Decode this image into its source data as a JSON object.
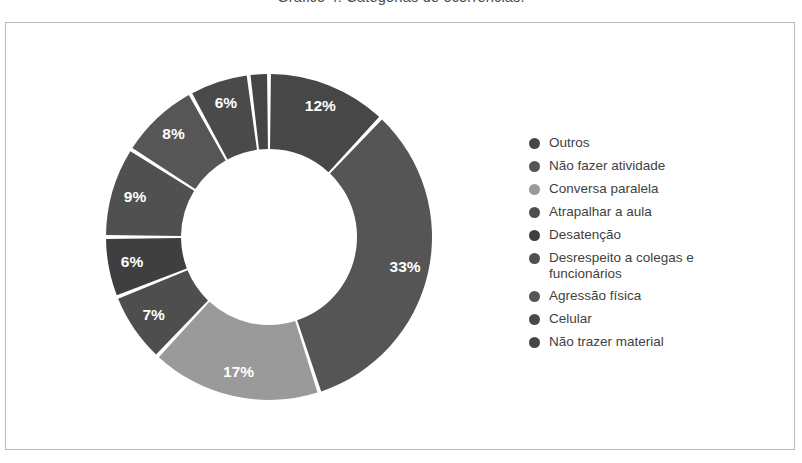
{
  "figure": {
    "title": "Gráfico 4: Categorias de ocorrências."
  },
  "chart_data": {
    "type": "pie",
    "variant": "donut",
    "title": "Gráfico 4: Categorias de ocorrências.",
    "xlabel": "",
    "ylabel": "",
    "legend_position": "right",
    "grid": false,
    "value_unit": "%",
    "start_angle_deg": 0,
    "direction": "clockwise",
    "labels": [
      "Outros",
      "Não fazer atividade",
      "Conversa paralela",
      "Atrapalhar a aula",
      "Desatenção",
      "Desrespeito a colegas e funcionários",
      "Agressão física",
      "Celular",
      "Não trazer material"
    ],
    "values": [
      12,
      33,
      17,
      7,
      6,
      9,
      8,
      6,
      2
    ],
    "display_values": [
      "12%",
      "33%",
      "17%",
      "7%",
      "6%",
      "9%",
      "8%",
      "6%",
      ""
    ],
    "colors": [
      "#474747",
      "#555555",
      "#9a9a9a",
      "#4e4e4e",
      "#3f3f3f",
      "#505050",
      "#565656",
      "#4a4a4a",
      "#454545"
    ]
  },
  "legend": {
    "items": [
      {
        "label": "Outros",
        "color": "#474747"
      },
      {
        "label": "Não fazer atividade",
        "color": "#555555"
      },
      {
        "label": "Conversa paralela",
        "color": "#9a9a9a"
      },
      {
        "label": "Atrapalhar a aula",
        "color": "#4e4e4e"
      },
      {
        "label": "Desatenção",
        "color": "#3f3f3f"
      },
      {
        "label": "Desrespeito a colegas e funcionários",
        "color": "#505050"
      },
      {
        "label": "Agressão física",
        "color": "#565656"
      },
      {
        "label": "Celular",
        "color": "#4a4a4a"
      },
      {
        "label": "Não trazer material",
        "color": "#454545"
      }
    ]
  }
}
